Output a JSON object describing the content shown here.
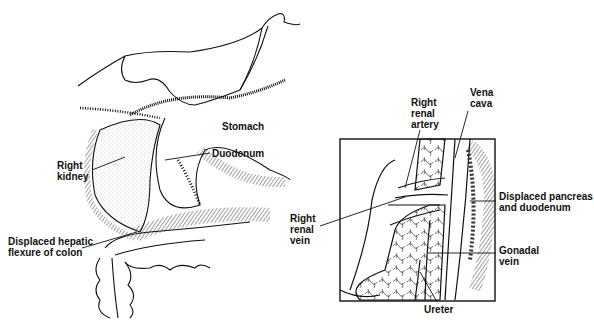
{
  "left_panel": {
    "labels": {
      "stomach": "Stomach",
      "duodenum": "Duodenum",
      "right_kidney": "Right\nkidney",
      "hepatic_flexure": "Displaced hepatic\nflexure of colon"
    }
  },
  "right_panel": {
    "labels": {
      "right_renal_artery": "Right\nrenal\nartery",
      "vena_cava": "Vena\ncava",
      "right_renal_vein": "Right\nrenal\nvein",
      "displaced_pancreas": "Displaced pancreas\nand duodenum",
      "gonadal_vein": "Gonadal\nvein",
      "ureter": "Ureter"
    }
  },
  "colors": {
    "ink": "#111111",
    "background": "#ffffff"
  }
}
